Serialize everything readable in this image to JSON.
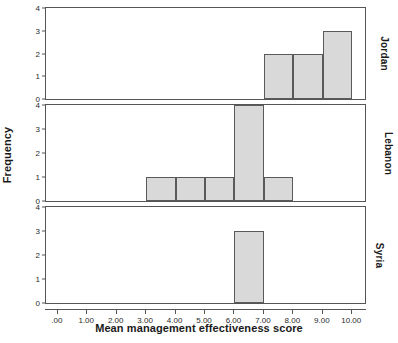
{
  "chart_data": {
    "type": "bar",
    "title": "",
    "xlabel": "Mean management effectiveness score",
    "ylabel": "Frequency",
    "xlim": [
      -0.4,
      10.5
    ],
    "ylim": [
      0,
      4
    ],
    "grid": false,
    "legend_position": "none",
    "bin_width": 1,
    "panel_layout": "stacked-vertical",
    "panel_label_position": "right",
    "x_ticks": [
      {
        "value": 0,
        "label": ".00"
      },
      {
        "value": 1,
        "label": "1.00"
      },
      {
        "value": 2,
        "label": "2.00"
      },
      {
        "value": 3,
        "label": "3.00"
      },
      {
        "value": 4,
        "label": "4.00"
      },
      {
        "value": 5,
        "label": "5.00"
      },
      {
        "value": 6,
        "label": "6.00"
      },
      {
        "value": 7,
        "label": "7.00"
      },
      {
        "value": 8,
        "label": "8.00"
      },
      {
        "value": 9,
        "label": "9.00"
      },
      {
        "value": 10,
        "label": "10.00"
      }
    ],
    "y_ticks": [
      {
        "value": 0,
        "label": "0"
      },
      {
        "value": 1,
        "label": "1"
      },
      {
        "value": 2,
        "label": "2"
      },
      {
        "value": 3,
        "label": "3"
      },
      {
        "value": 4,
        "label": "4"
      }
    ],
    "colors": {
      "bar_fill": "#d9d9d9",
      "bar_border": "#5a5a5a",
      "panel_border": "#555555",
      "text": "#1a1a1a",
      "background": "#ffffff"
    },
    "panels": [
      {
        "name": "Jordan",
        "bins": [
          {
            "x0": 7,
            "x1": 8,
            "frequency": 2
          },
          {
            "x0": 8,
            "x1": 9,
            "frequency": 2
          },
          {
            "x0": 9,
            "x1": 10,
            "frequency": 3
          }
        ]
      },
      {
        "name": "Lebanon",
        "bins": [
          {
            "x0": 3,
            "x1": 4,
            "frequency": 1
          },
          {
            "x0": 4,
            "x1": 5,
            "frequency": 1
          },
          {
            "x0": 5,
            "x1": 6,
            "frequency": 1
          },
          {
            "x0": 6,
            "x1": 7,
            "frequency": 4
          },
          {
            "x0": 7,
            "x1": 8,
            "frequency": 1
          }
        ]
      },
      {
        "name": "Syria",
        "bins": [
          {
            "x0": 6,
            "x1": 7,
            "frequency": 3
          }
        ]
      }
    ]
  }
}
